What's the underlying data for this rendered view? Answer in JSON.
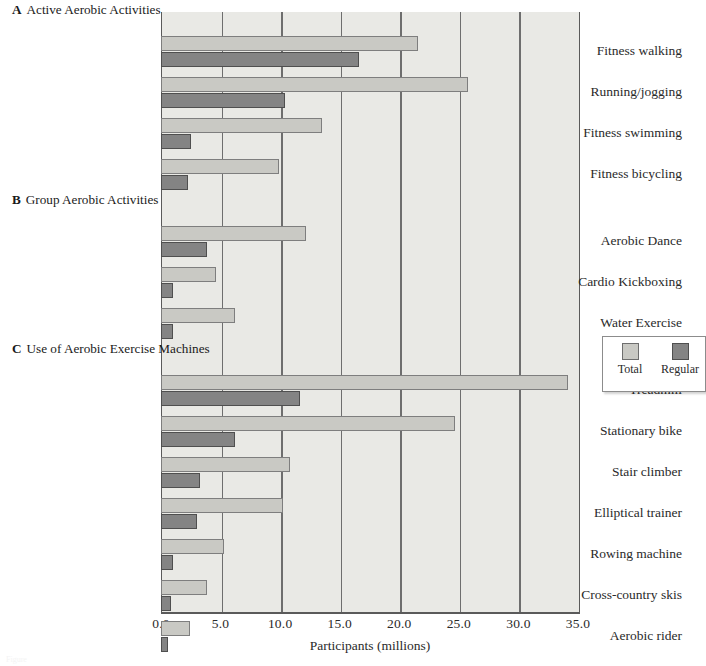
{
  "figure": {
    "caption_fragment": "Figure",
    "legend": {
      "items": [
        {
          "label": "Total",
          "color": "#c9c9c4",
          "key": "total"
        },
        {
          "label": "Regular",
          "color": "#848484",
          "key": "regular"
        }
      ]
    }
  },
  "chart_data": {
    "type": "bar",
    "orientation": "horizontal",
    "title": "",
    "xlabel": "Participants (millions)",
    "ylabel": "",
    "xlim": [
      0.0,
      35.0
    ],
    "xticks": [
      "0.0",
      "5.0",
      "10.0",
      "15.0",
      "20.0",
      "25.0",
      "30.0",
      "35.0"
    ],
    "xtick_values": [
      0,
      5,
      10,
      15,
      20,
      25,
      30,
      35
    ],
    "grid": "vertical",
    "legend_position": "right-outside",
    "series": [
      {
        "name": "Total",
        "color": "#c9c9c4"
      },
      {
        "name": "Regular",
        "color": "#848484"
      }
    ],
    "groups": [
      {
        "letter": "A",
        "title": "Active Aerobic Activities",
        "categories": [
          "Fitness walking",
          "Running/jogging",
          "Fitness swimming",
          "Fitness bicycling"
        ],
        "total": [
          21.6,
          25.8,
          13.5,
          9.9
        ],
        "regular": [
          16.6,
          10.4,
          2.5,
          2.3
        ]
      },
      {
        "letter": "B",
        "title": "Group Aerobic Activities",
        "categories": [
          "Aerobic Dance",
          "Cardio Kickboxing",
          "Water Exercise"
        ],
        "total": [
          12.2,
          4.6,
          6.2
        ],
        "regular": [
          3.9,
          1.0,
          1.0
        ]
      },
      {
        "letter": "C",
        "title": "Use of Aerobic Exercise Machines",
        "categories": [
          "Treadmill",
          "Stationary bike",
          "Stair climber",
          "Elliptical trainer",
          "Rowing machine",
          "Cross-country skis",
          "Aerobic rider"
        ],
        "total": [
          34.2,
          24.7,
          10.8,
          10.2,
          5.3,
          3.9,
          2.4
        ],
        "regular": [
          11.7,
          6.2,
          3.3,
          3.0,
          1.0,
          0.8,
          0.6
        ]
      }
    ]
  }
}
